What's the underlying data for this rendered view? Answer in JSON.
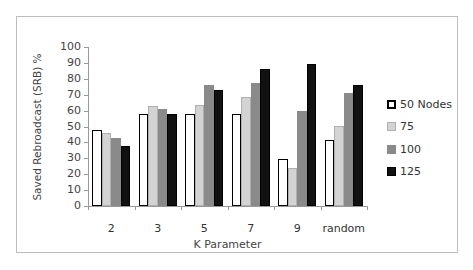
{
  "chart_data": {
    "type": "bar",
    "title": "",
    "xlabel": "K Parameter",
    "ylabel": "Saved Rebroadcast (SRB) %",
    "ylim": [
      0,
      100
    ],
    "yticks": [
      0,
      10,
      20,
      30,
      40,
      50,
      60,
      70,
      80,
      90,
      100
    ],
    "grid": false,
    "legend_position": "right",
    "categories": [
      "2",
      "3",
      "5",
      "7",
      "9",
      "random"
    ],
    "series": [
      {
        "name": "50 Nodes",
        "color": "#ffffff",
        "border": "#000000",
        "values": [
          48,
          58,
          58,
          58,
          29.5,
          41.5
        ]
      },
      {
        "name": "75",
        "color": "#d3d3d3",
        "border": "#b0b0b0",
        "values": [
          46,
          63,
          63.5,
          68.5,
          24,
          50.5
        ]
      },
      {
        "name": "100",
        "color": "#8a8a8a",
        "border": "#8a8a8a",
        "values": [
          43,
          61,
          76,
          77.5,
          60,
          71
        ]
      },
      {
        "name": "125",
        "color": "#111111",
        "border": "#000000",
        "values": [
          38,
          58,
          73,
          86,
          89,
          76
        ]
      }
    ]
  }
}
